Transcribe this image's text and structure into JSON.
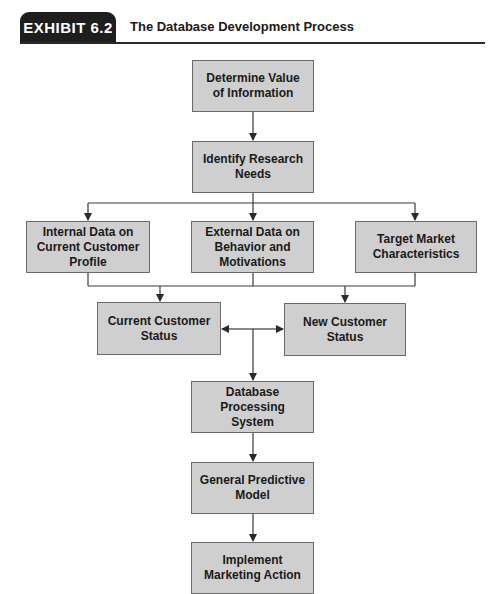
{
  "header": {
    "exhibit_label": "EXHIBIT 6.2",
    "title": "The Database Development Process"
  },
  "colors": {
    "box_fill": "#cfcfcf",
    "box_border": "#6a6a6a",
    "tab_fill": "#1e1e1e",
    "line": "#3a3a3a"
  },
  "nodes": {
    "determine": "Determine Value of Information",
    "identify": "Identify Research Needs",
    "internal": "Internal Data on Current Customer Profile",
    "external": "External Data on Behavior and Motivations",
    "target": "Target Market Characteristics",
    "current": "Current Customer Status",
    "new": "New Customer Status",
    "database": "Database Processing System",
    "predictive": "General Predictive Model",
    "implement": "Implement Marketing Action"
  },
  "edges": [
    {
      "from": "determine",
      "to": "identify"
    },
    {
      "from": "identify",
      "to": "internal"
    },
    {
      "from": "identify",
      "to": "external"
    },
    {
      "from": "identify",
      "to": "target"
    },
    {
      "from": "internal",
      "to": "current"
    },
    {
      "from": "external",
      "to": "current"
    },
    {
      "from": "external",
      "to": "new"
    },
    {
      "from": "target",
      "to": "new"
    },
    {
      "from": "database",
      "to": "current"
    },
    {
      "from": "database",
      "to": "new"
    },
    {
      "from": "current",
      "to": "database"
    },
    {
      "from": "database",
      "to": "predictive"
    },
    {
      "from": "predictive",
      "to": "implement"
    }
  ]
}
